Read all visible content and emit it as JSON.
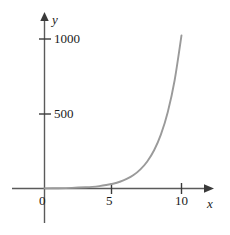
{
  "chart_data": {
    "type": "line",
    "title": "",
    "xlabel": "x",
    "ylabel": "y",
    "xlim": [
      -2.3,
      13.4
    ],
    "ylim": [
      -250,
      1150
    ],
    "grid": false,
    "legend": null,
    "xticks": [
      0,
      5,
      10
    ],
    "xtick_labels": [
      "0",
      "5",
      "10"
    ],
    "yticks": [
      500,
      1000
    ],
    "ytick_labels": [
      "500",
      "1000"
    ],
    "series": [
      {
        "name": "exponential curve",
        "color": "#9a9a9a",
        "x": [
          0,
          1,
          2,
          3,
          3.5,
          4,
          4.5,
          5,
          5.5,
          6,
          6.5,
          7,
          7.5,
          8,
          8.5,
          9,
          9.5,
          10
        ],
        "y": [
          1,
          2,
          4,
          8,
          11,
          16,
          23,
          32,
          45,
          64,
          90,
          128,
          181,
          256,
          362,
          512,
          724,
          1024
        ]
      }
    ],
    "annotations": []
  },
  "axes": {
    "y_axis_label": "y",
    "x_axis_label": "x",
    "y_tick_1000": "1000",
    "y_tick_500": "500",
    "x_tick_0": "0",
    "x_tick_5": "5",
    "x_tick_10": "10"
  },
  "colors": {
    "curve": "#9a9a9a",
    "axis": "#555555",
    "text": "#1a1a1a",
    "background": "#ffffff"
  }
}
